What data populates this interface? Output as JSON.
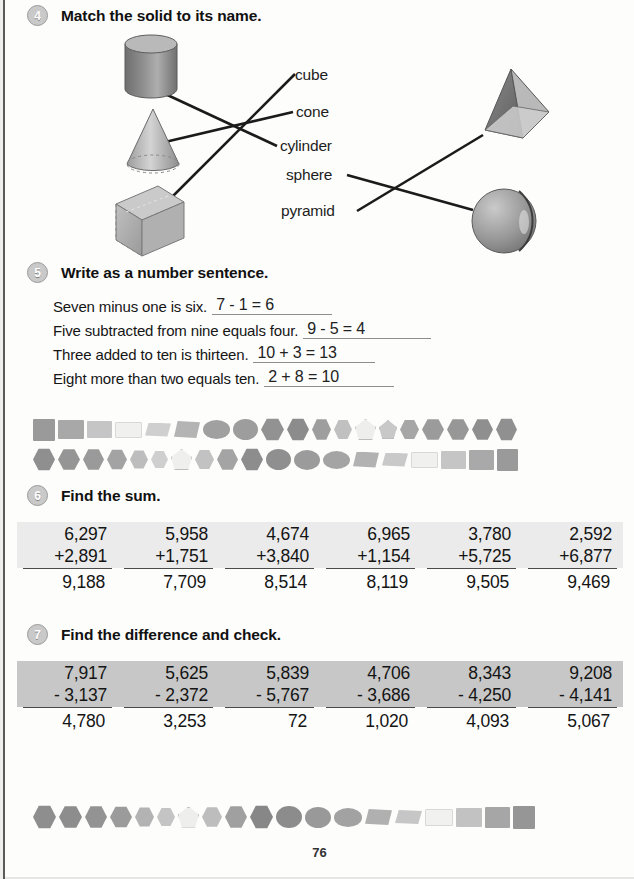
{
  "page": {
    "number": "76"
  },
  "exercise4": {
    "number": "4",
    "title": "Match the solid to its name.",
    "solids_left": [
      {
        "name": "cylinder-solid",
        "label": "cylinder"
      },
      {
        "name": "cone-solid",
        "label": "cone"
      },
      {
        "name": "cube-solid",
        "label": "cube"
      }
    ],
    "solids_right": [
      {
        "name": "pyramid-solid",
        "label": "pyramid"
      },
      {
        "name": "sphere-solid",
        "label": "sphere"
      }
    ],
    "labels": [
      "cube",
      "cone",
      "cylinder",
      "sphere",
      "pyramid"
    ],
    "matches": [
      {
        "from": "cylinder-solid",
        "to": "cylinder"
      },
      {
        "from": "cone-solid",
        "to": "cone"
      },
      {
        "from": "cube-solid",
        "to": "cube"
      },
      {
        "from": "sphere",
        "to": "sphere-solid"
      },
      {
        "from": "pyramid",
        "to": "pyramid-solid"
      }
    ]
  },
  "exercise5": {
    "number": "5",
    "title": "Write as a number sentence.",
    "items": [
      {
        "prompt": "Seven minus one is six.",
        "answer": "7 - 1 = 6"
      },
      {
        "prompt": "Five subtracted from nine equals four.",
        "answer": "9 - 5 = 4"
      },
      {
        "prompt": "Three added to ten is thirteen.",
        "answer": "10 + 3 = 13"
      },
      {
        "prompt": "Eight more than two equals ten.",
        "answer": "2 + 8 = 10"
      }
    ]
  },
  "exercise6": {
    "number": "6",
    "title": "Find the sum.",
    "problems": [
      {
        "top": "6,297",
        "bottom": "+2,891",
        "answer": "9,188"
      },
      {
        "top": "5,958",
        "bottom": "+1,751",
        "answer": "7,709"
      },
      {
        "top": "4,674",
        "bottom": "+3,840",
        "answer": "8,514"
      },
      {
        "top": "6,965",
        "bottom": "+1,154",
        "answer": "8,119"
      },
      {
        "top": "3,780",
        "bottom": "+5,725",
        "answer": "9,505"
      },
      {
        "top": "2,592",
        "bottom": "+6,877",
        "answer": "9,469"
      }
    ]
  },
  "exercise7": {
    "number": "7",
    "title": "Find the difference and check.",
    "problems": [
      {
        "top": "7,917",
        "bottom": "- 3,137",
        "answer": "4,780"
      },
      {
        "top": "5,625",
        "bottom": "- 2,372",
        "answer": "3,253"
      },
      {
        "top": "5,839",
        "bottom": "- 5,767",
        "answer": "72"
      },
      {
        "top": "4,706",
        "bottom": "- 3,686",
        "answer": "1,020"
      },
      {
        "top": "8,343",
        "bottom": "- 4,250",
        "answer": "4,093"
      },
      {
        "top": "9,208",
        "bottom": "- 4,141",
        "answer": "5,067"
      }
    ]
  },
  "decor": {
    "strip1": [
      {
        "shape": "square",
        "color": "#9a9a9a",
        "w": 22,
        "h": 22
      },
      {
        "shape": "rect",
        "color": "#a8a8a8",
        "w": 26,
        "h": 19
      },
      {
        "shape": "rect",
        "color": "#c5c5c5",
        "w": 25,
        "h": 17
      },
      {
        "shape": "rect",
        "color": "#f0f0ee",
        "w": 27,
        "h": 16
      },
      {
        "shape": "rhomb",
        "color": "#cfcfcf",
        "w": 26,
        "h": 14
      },
      {
        "shape": "rhomb",
        "color": "#b4b4b4",
        "w": 26,
        "h": 17
      },
      {
        "shape": "oval",
        "color": "#a0a0a0",
        "w": 27,
        "h": 19
      },
      {
        "shape": "oval",
        "color": "#9d9d9d",
        "w": 25,
        "h": 21
      },
      {
        "shape": "hex",
        "color": "#929292",
        "w": 23,
        "h": 23
      },
      {
        "shape": "hex",
        "color": "#8c8c8c",
        "w": 22,
        "h": 23
      },
      {
        "shape": "hex",
        "color": "#9e9e9e",
        "w": 19,
        "h": 22
      },
      {
        "shape": "hex",
        "color": "#c0c0c0",
        "w": 18,
        "h": 20
      },
      {
        "shape": "pent",
        "color": "#eeeeec",
        "w": 21,
        "h": 21
      },
      {
        "shape": "pent",
        "color": "#c8c8c8",
        "w": 18,
        "h": 19
      },
      {
        "shape": "hex",
        "color": "#a6a6a6",
        "w": 19,
        "h": 20
      },
      {
        "shape": "hex",
        "color": "#9b9b9b",
        "w": 22,
        "h": 22
      },
      {
        "shape": "hex",
        "color": "#979797",
        "w": 22,
        "h": 22
      },
      {
        "shape": "hex",
        "color": "#8f8f8f",
        "w": 21,
        "h": 22
      },
      {
        "shape": "hex",
        "color": "#909090",
        "w": 21,
        "h": 23
      }
    ],
    "strip2": [
      {
        "shape": "hex",
        "color": "#8f8f8f",
        "w": 22,
        "h": 23
      },
      {
        "shape": "hex",
        "color": "#959595",
        "w": 22,
        "h": 22
      },
      {
        "shape": "hex",
        "color": "#9a9a9a",
        "w": 21,
        "h": 22
      },
      {
        "shape": "hex",
        "color": "#a3a3a3",
        "w": 20,
        "h": 21
      },
      {
        "shape": "hex",
        "color": "#bdbdbd",
        "w": 18,
        "h": 19
      },
      {
        "shape": "hex",
        "color": "#cfcfcf",
        "w": 17,
        "h": 18
      },
      {
        "shape": "pent",
        "color": "#efefed",
        "w": 21,
        "h": 21
      },
      {
        "shape": "hex",
        "color": "#c2c2c2",
        "w": 19,
        "h": 20
      },
      {
        "shape": "hex",
        "color": "#a4a4a4",
        "w": 21,
        "h": 22
      },
      {
        "shape": "hex",
        "color": "#8d8d8d",
        "w": 22,
        "h": 23
      },
      {
        "shape": "oval",
        "color": "#8f8f8f",
        "w": 25,
        "h": 21
      },
      {
        "shape": "oval",
        "color": "#9b9b9b",
        "w": 26,
        "h": 20
      },
      {
        "shape": "oval",
        "color": "#a4a4a4",
        "w": 27,
        "h": 18
      },
      {
        "shape": "rhomb",
        "color": "#b2b2b2",
        "w": 26,
        "h": 16
      },
      {
        "shape": "rhomb",
        "color": "#c9c9c9",
        "w": 26,
        "h": 14
      },
      {
        "shape": "rect",
        "color": "#f0f0ee",
        "w": 27,
        "h": 16
      },
      {
        "shape": "rect",
        "color": "#c5c5c5",
        "w": 25,
        "h": 18
      },
      {
        "shape": "rect",
        "color": "#a9a9a9",
        "w": 25,
        "h": 20
      },
      {
        "shape": "square",
        "color": "#9a9a9a",
        "w": 21,
        "h": 22
      }
    ],
    "strip3": [
      {
        "shape": "hex",
        "color": "#8e8e8e",
        "w": 23,
        "h": 24
      },
      {
        "shape": "hex",
        "color": "#8d8d8d",
        "w": 23,
        "h": 23
      },
      {
        "shape": "hex",
        "color": "#939393",
        "w": 22,
        "h": 23
      },
      {
        "shape": "hex",
        "color": "#9b9b9b",
        "w": 22,
        "h": 22
      },
      {
        "shape": "hex",
        "color": "#b3b3b3",
        "w": 19,
        "h": 20
      },
      {
        "shape": "hex",
        "color": "#c4c4c4",
        "w": 18,
        "h": 19
      },
      {
        "shape": "pent",
        "color": "#eeeeec",
        "w": 21,
        "h": 21
      },
      {
        "shape": "hex",
        "color": "#bdbdbd",
        "w": 20,
        "h": 21
      },
      {
        "shape": "hex",
        "color": "#a0a0a0",
        "w": 22,
        "h": 23
      },
      {
        "shape": "hex",
        "color": "#878787",
        "w": 23,
        "h": 24
      },
      {
        "shape": "oval",
        "color": "#8c8c8c",
        "w": 26,
        "h": 22
      },
      {
        "shape": "oval",
        "color": "#999999",
        "w": 26,
        "h": 21
      },
      {
        "shape": "oval",
        "color": "#a2a2a2",
        "w": 28,
        "h": 19
      },
      {
        "shape": "rhomb",
        "color": "#b0b0b0",
        "w": 27,
        "h": 16
      },
      {
        "shape": "rhomb",
        "color": "#c6c6c6",
        "w": 27,
        "h": 14
      },
      {
        "shape": "rect",
        "color": "#f1f1ef",
        "w": 28,
        "h": 17
      },
      {
        "shape": "rect",
        "color": "#c2c2c2",
        "w": 26,
        "h": 19
      },
      {
        "shape": "rect",
        "color": "#a6a6a6",
        "w": 25,
        "h": 21
      },
      {
        "shape": "square",
        "color": "#969696",
        "w": 22,
        "h": 23
      }
    ]
  }
}
